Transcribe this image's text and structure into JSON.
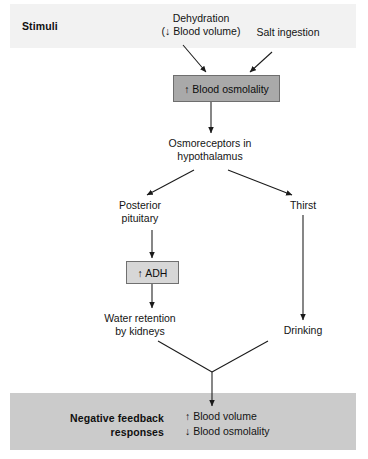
{
  "diagram": {
    "title_stimuli": "Stimuli",
    "title_feedback": "Negative feedback\nresponses",
    "nodes": {
      "dehydration": "Dehydration\n(↓ Blood volume)",
      "salt_ingestion": "Salt ingestion",
      "blood_osmolality_box": "↑ Blood osmolality",
      "osmoreceptors": "Osmoreceptors in\nhypothalamus",
      "posterior_pituitary": "Posterior\npituitary",
      "thirst": "Thirst",
      "adh_box": "↑ ADH",
      "water_retention": "Water retention\nby kidneys",
      "drinking": "Drinking",
      "feedback_results": "↑ Blood volume\n↓ Blood osmolality"
    },
    "colors": {
      "band_stimuli": "#f2f2f2",
      "band_feedback": "#cbcbcb",
      "box_osmolality_fill": "#a9a9a9",
      "box_osmolality_border": "#6e6e6e",
      "box_adh_fill": "#d7d7d7",
      "box_adh_border": "#707070",
      "arrow": "#1a1a1a",
      "text": "#141414",
      "background": "#ffffff"
    }
  }
}
